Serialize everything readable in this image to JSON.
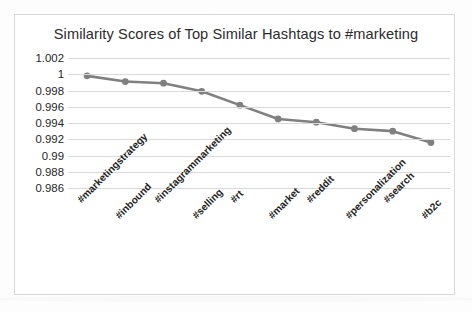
{
  "chart_data": {
    "type": "line",
    "title": "Similarity Scores of Top Similar Hashtags to #marketing",
    "xlabel": "",
    "ylabel": "",
    "categories": [
      "#marketingstrategy",
      "#inbound",
      "#instagrammarketing",
      "#selling",
      "#rt",
      "#market",
      "#reddit",
      "#personalization",
      "#search",
      "#b2c"
    ],
    "values": [
      0.9998,
      0.9991,
      0.9989,
      0.9979,
      0.9962,
      0.9945,
      0.9941,
      0.9933,
      0.993,
      0.9916
    ],
    "series": [
      {
        "name": "Similarity Score",
        "values": [
          0.9998,
          0.9991,
          0.9989,
          0.9979,
          0.9962,
          0.9945,
          0.9941,
          0.9933,
          0.993,
          0.9916
        ]
      }
    ],
    "ylim": [
      0.986,
      1.002
    ],
    "yticks": [
      1.002,
      1,
      0.998,
      0.996,
      0.994,
      0.992,
      0.99,
      0.988,
      0.986
    ],
    "ytick_labels": [
      "1.002",
      "1",
      "0.998",
      "0.996",
      "0.994",
      "0.992",
      "0.99",
      "0.988",
      "0.986"
    ],
    "grid": true,
    "legend": false,
    "legend_position": "none",
    "line_color": "#808080",
    "marker_color": "#808080",
    "gridline_color": "#d9d9d9",
    "background_color": "#ffffff",
    "marker": "circle"
  }
}
